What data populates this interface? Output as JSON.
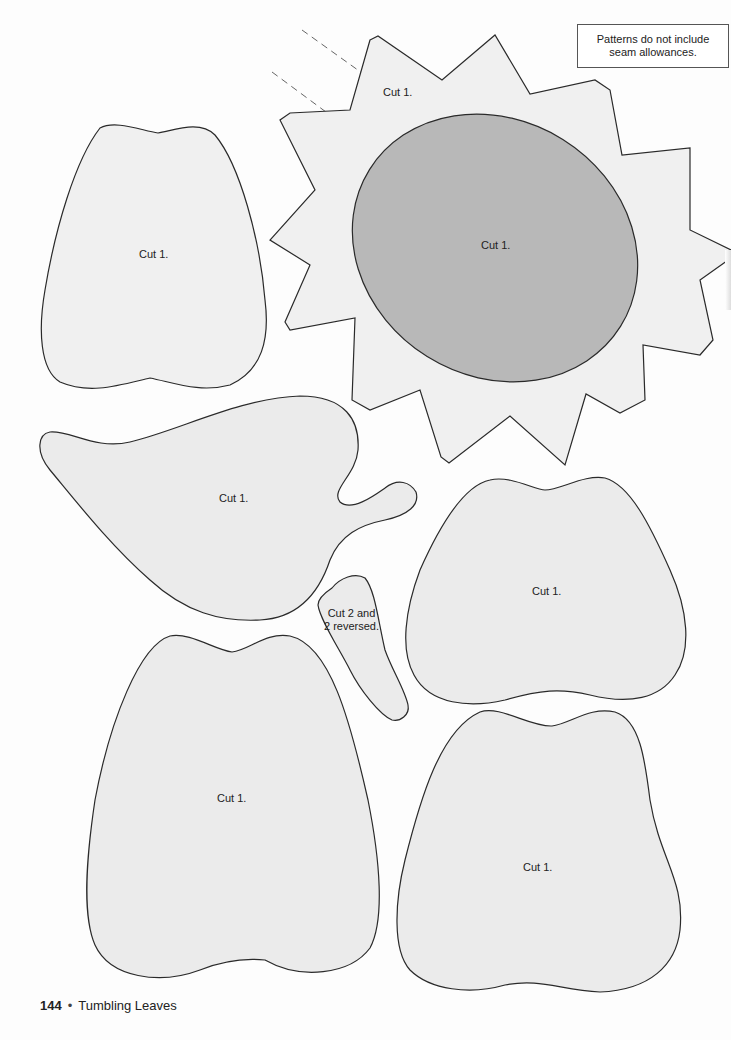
{
  "note": {
    "line1": "Patterns do not include",
    "line2": "seam allowances."
  },
  "pieces": [
    {
      "id": "sun-outer",
      "label": "Cut 1."
    },
    {
      "id": "sun-center",
      "label": "Cut 1."
    },
    {
      "id": "pear-top-left",
      "label": "Cut 1."
    },
    {
      "id": "leaf",
      "label": "Cut 1."
    },
    {
      "id": "small-leaf",
      "label_line1": "Cut 2 and",
      "label_line2": "2 reversed."
    },
    {
      "id": "pear-mid-right",
      "label": "Cut 1."
    },
    {
      "id": "pear-bottom-left",
      "label": "Cut 1."
    },
    {
      "id": "pear-bottom-right",
      "label": "Cut 1."
    }
  ],
  "colors": {
    "piece_fill": "#ebebeb",
    "sun_center_fill": "#b8b8b8",
    "outline": "#2a2a2a"
  },
  "footer": {
    "page_number": "144",
    "separator": "•",
    "title": "Tumbling Leaves"
  }
}
